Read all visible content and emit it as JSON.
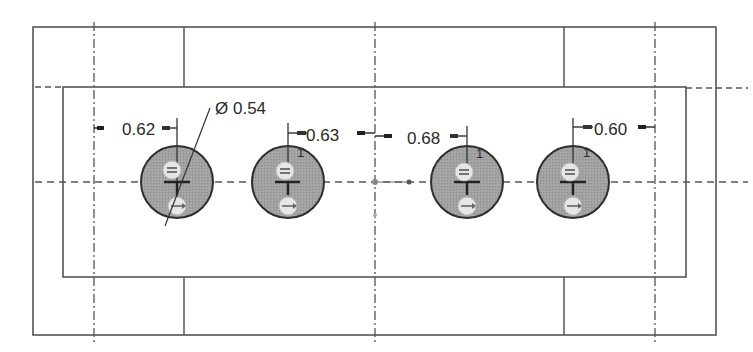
{
  "drawing": {
    "type": "cad-sketch",
    "view": "top view of rectangular plate with hole pattern",
    "colors": {
      "line": "#4a4a4a",
      "centerline": "#555555",
      "hole_fill": "#9a9a9a",
      "hole_edge": "#2e2e2e",
      "symbol_fill": "#e6e6e6",
      "text": "#2a2a2a"
    },
    "diameter": {
      "symbol": "Ø",
      "value": "0.54"
    },
    "dimensions": [
      {
        "id": "dim-1",
        "value": "0.62"
      },
      {
        "id": "dim-2",
        "value": "0.63"
      },
      {
        "id": "dim-3",
        "value": "0.68"
      },
      {
        "id": "dim-4",
        "value": "0.60"
      }
    ],
    "holes": [
      {
        "id": "hole-1",
        "constraint_top": "equal-icon",
        "constraint_bottom": "horizontal-align-icon"
      },
      {
        "id": "hole-2",
        "constraint_top": "equal-icon",
        "constraint_bottom": "horizontal-align-icon",
        "marker": "1"
      },
      {
        "id": "hole-3",
        "constraint_top": "equal-icon",
        "constraint_bottom": "horizontal-align-icon",
        "marker": "1"
      },
      {
        "id": "hole-4",
        "constraint_top": "equal-icon",
        "constraint_bottom": "horizontal-align-icon",
        "marker": "1"
      }
    ]
  }
}
